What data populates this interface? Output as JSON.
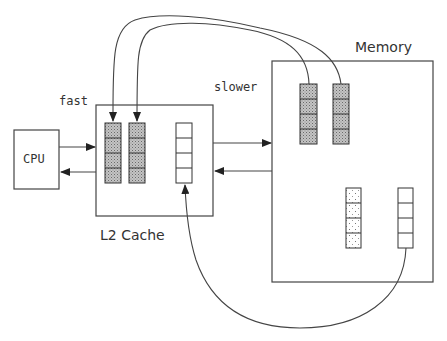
{
  "diagram": {
    "labels": {
      "cpu": "CPU",
      "fast": "fast",
      "slower": "slower",
      "memory": "Memory",
      "cache": "L2 Cache"
    },
    "nodes": [
      {
        "id": "cpu",
        "label": "CPU"
      },
      {
        "id": "l2-cache",
        "label": "L2 Cache",
        "blocks": [
          {
            "id": "cache-block-1",
            "fill": "dense-shaded",
            "cells": 4
          },
          {
            "id": "cache-block-2",
            "fill": "dense-shaded",
            "cells": 4
          },
          {
            "id": "cache-block-3",
            "fill": "empty",
            "cells": 4
          }
        ]
      },
      {
        "id": "memory",
        "label": "Memory",
        "blocks": [
          {
            "id": "memory-block-1",
            "fill": "dense-shaded",
            "cells": 4
          },
          {
            "id": "memory-block-2",
            "fill": "dense-shaded",
            "cells": 4
          },
          {
            "id": "memory-block-3",
            "fill": "sparse-dotted",
            "cells": 4
          },
          {
            "id": "memory-block-4",
            "fill": "empty",
            "cells": 4
          }
        ]
      }
    ],
    "edges": [
      {
        "from": "cpu",
        "to": "l2-cache",
        "label": "fast"
      },
      {
        "from": "l2-cache",
        "to": "cpu"
      },
      {
        "from": "l2-cache",
        "to": "memory",
        "label": "slower"
      },
      {
        "from": "memory",
        "to": "l2-cache"
      },
      {
        "from": "memory-block-1",
        "to": "cache-block-2"
      },
      {
        "from": "memory-block-2",
        "to": "cache-block-1"
      },
      {
        "from": "memory-block-4",
        "to": "cache-block-3"
      }
    ],
    "colors": {
      "stroke": "#444444",
      "shade": "#b0b0b0",
      "background": "#ffffff"
    }
  }
}
